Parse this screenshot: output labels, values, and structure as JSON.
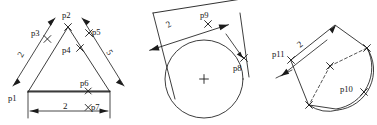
{
  "drawing": {
    "title": "Geometric constraint sketches",
    "background_color": "#ffffff",
    "line_color": "#1b1b1b",
    "figure_count": 3
  },
  "figures": [
    {
      "name": "triangle-with-dimensions",
      "shape": "triangle",
      "point_labels": [
        "p1",
        "p2",
        "p3",
        "p4",
        "p5",
        "p6",
        "p7"
      ],
      "dimensions": [
        {
          "value": "2",
          "location": "left-side"
        },
        {
          "value": "5",
          "location": "right-side"
        },
        {
          "value": "2",
          "location": "bottom"
        }
      ]
    },
    {
      "name": "circle-with-tangents",
      "shape": "circle",
      "point_labels": [
        "p8",
        "p9"
      ],
      "dimensions": [
        {
          "value": "2",
          "location": "top-tangent"
        }
      ]
    },
    {
      "name": "arc-fillet-shape",
      "shape": "arc-sector",
      "point_labels": [
        "p10",
        "p11"
      ],
      "dimensions": [
        {
          "value": "2",
          "location": "upper-left-edge"
        }
      ]
    }
  ],
  "labels": {
    "p1": "p1",
    "p2": "p2",
    "p3": "p3",
    "p4": "p4",
    "p5": "p5",
    "p6": "p6",
    "p7": "p7",
    "p8": "p8",
    "p9": "p9",
    "p10": "p10",
    "p11": "p11"
  },
  "dimension_values": {
    "fig1_left": "2",
    "fig1_right": "5",
    "fig1_bottom": "2",
    "fig2_top": "2",
    "fig3_edge": "2"
  }
}
